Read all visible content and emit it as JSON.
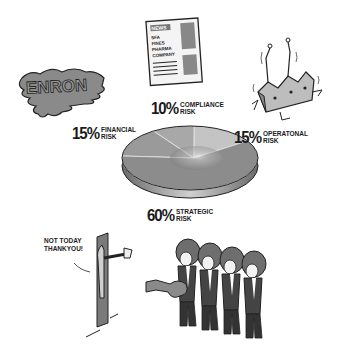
{
  "chart_data": {
    "type": "pie",
    "title": "",
    "style": "3d-illustrated",
    "series": [
      {
        "name": "Strategic Risk",
        "value": 60,
        "label_pct": "60%",
        "label_line1": "STRATEGIC",
        "label_line2": "RISK",
        "illustration": "band-at-door"
      },
      {
        "name": "Financial Risk",
        "value": 15,
        "label_pct": "15%",
        "label_line1": "FINANCIAL",
        "label_line2": "RISK",
        "illustration": "melting-enron-logo"
      },
      {
        "name": "Compliance Risk",
        "value": 10,
        "label_pct": "10%",
        "label_line1": "COMPLIANCE",
        "label_line2": "RISK",
        "illustration": "newspaper"
      },
      {
        "name": "Operational Risk",
        "value": 15,
        "label_pct": "15%",
        "label_line1": "OPERATONAL",
        "label_line2": "RISK",
        "illustration": "collapsing-factory"
      }
    ],
    "colors": {
      "slice": "#8a8a8a",
      "slice_light": "#bdbdbd",
      "edge": "#555555",
      "outline": "#222222"
    }
  },
  "illustrations": {
    "enron_logo_text": "ENRON",
    "newspaper": {
      "masthead": "NEWS",
      "headline_lines": [
        "SFA",
        "FINES",
        "PHARMA",
        "COMPANY"
      ]
    },
    "speech_bubble_lines": [
      "NOT TODAY",
      "THANKYOU!"
    ]
  }
}
